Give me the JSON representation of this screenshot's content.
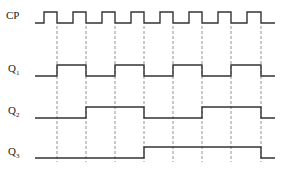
{
  "signals": [
    {
      "name": "CP",
      "sub": "",
      "label_y": 17,
      "high_y": 12,
      "low_y": 23
    },
    {
      "name": "Q",
      "sub": "1",
      "label_y": 70,
      "high_y": 65,
      "low_y": 76
    },
    {
      "name": "Q",
      "sub": "2",
      "label_y": 112,
      "high_y": 107,
      "low_y": 118
    },
    {
      "name": "Q",
      "sub": "3",
      "label_y": 153,
      "high_y": 147,
      "low_y": 158
    }
  ],
  "timing": {
    "start_x": 35,
    "end_x": 275,
    "falling_edges_x": [
      57,
      86,
      115,
      144,
      173,
      202,
      231,
      261
    ],
    "cp_rising_x": [
      44,
      73,
      102,
      131,
      160,
      189,
      218,
      247
    ],
    "dashed_top": 26,
    "dashed_bottom": 162
  },
  "waveforms": {
    "Q1": [
      0,
      1,
      0,
      1,
      0,
      1,
      0,
      1,
      0
    ],
    "Q2": [
      0,
      0,
      1,
      1,
      0,
      0,
      1,
      1,
      0
    ],
    "Q3": [
      0,
      0,
      0,
      0,
      1,
      1,
      1,
      1,
      0
    ]
  },
  "colors": {
    "line": "#333333",
    "dash": "#777777"
  }
}
